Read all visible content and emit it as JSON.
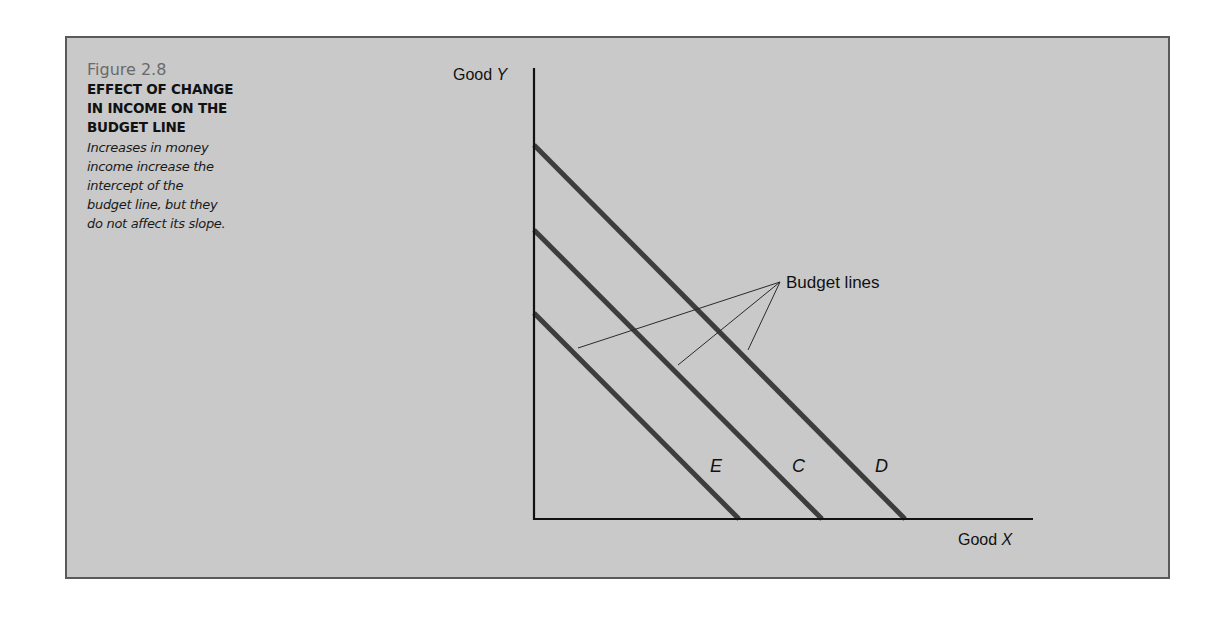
{
  "figure": {
    "number": "Figure 2.8",
    "title_lines": [
      "EFFECT OF CHANGE",
      "IN INCOME ON THE",
      "BUDGET LINE"
    ],
    "description_lines": [
      "Increases in money",
      "income increase the",
      "intercept of the",
      "budget line, but they",
      "do not affect its slope."
    ]
  },
  "colors": {
    "panel_bg": "#c9c9c9",
    "panel_border": "#5a5a5a",
    "budget_line": "#3d3d3d",
    "axis": "#111111"
  },
  "chart_data": {
    "type": "line",
    "title": "Effect of Change in Income on the Budget Line",
    "xlabel": "Good X",
    "ylabel": "Good Y",
    "xlabel_prefix": "Good ",
    "xlabel_var": "X",
    "ylabel_prefix": "Good ",
    "ylabel_var": "Y",
    "grid": false,
    "ticks": "none",
    "annotation": "Budget lines",
    "series": [
      {
        "name": "E",
        "y_intercept": 0.545,
        "x_intercept": 0.41,
        "note": "lowest income"
      },
      {
        "name": "C",
        "y_intercept": 0.625,
        "x_intercept": 0.575
      },
      {
        "name": "D",
        "y_intercept": 0.815,
        "x_intercept": 0.74,
        "note": "highest income"
      }
    ],
    "relative_units_note": "intercepts as fraction of axis length; all lines parallel (same slope)"
  },
  "geometry": {
    "origin": [
      534,
      519
    ],
    "y_axis_top": 68,
    "x_axis_end": 1033,
    "lines": [
      {
        "name": "E",
        "x1": 534,
        "y1": 313,
        "x2": 739,
        "y2": 519,
        "label_x": 710,
        "label_y": 472
      },
      {
        "name": "C",
        "x1": 534,
        "y1": 230,
        "x2": 822,
        "y2": 519,
        "label_x": 792,
        "label_y": 472
      },
      {
        "name": "D",
        "x1": 534,
        "y1": 145,
        "x2": 905,
        "y2": 519,
        "label_x": 875,
        "label_y": 472
      }
    ],
    "leader_origin": [
      780,
      282
    ],
    "leader_ends": [
      [
        578,
        348
      ],
      [
        678,
        365
      ],
      [
        748,
        350
      ]
    ]
  }
}
